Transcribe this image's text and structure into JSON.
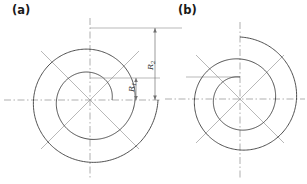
{
  "figure": {
    "kind": "engineering-drawing",
    "background_color": "#ffffff",
    "panels": [
      {
        "id": "a",
        "label": "(a)",
        "center": {
          "x": 90,
          "y": 100
        },
        "spiral": {
          "type": "archimedean",
          "turns": 1.0,
          "start_radius": 22,
          "end_radius": 68,
          "start_angle_deg": 0,
          "direction": "counterclockwise"
        },
        "color": "#3b3b3b",
        "line_width": 0.8
      },
      {
        "id": "b",
        "label": "(b)",
        "center": {
          "x": 240,
          "y": 99
        },
        "spiral": {
          "type": "archimedean",
          "turns": 1.0,
          "start_radius": 22,
          "end_radius": 62,
          "start_angle_deg": 90,
          "direction": "counterclockwise"
        },
        "color": "#3b3b3b",
        "line_width": 0.8
      }
    ],
    "dimensions": [
      {
        "name": "R1",
        "symbol": "R",
        "subscript": "1",
        "label": "R₁",
        "rotation_deg": -90,
        "text_x": 136,
        "text_y": 97,
        "extent_top_y": 78,
        "extent_bottom_y": 100,
        "line_x": 136
      },
      {
        "name": "R2",
        "symbol": "R",
        "subscript": "2",
        "label": "R₂",
        "rotation_deg": -90,
        "text_x": 155,
        "text_y": 62,
        "extent_top_y": 28,
        "extent_bottom_y": 100,
        "line_x": 155
      }
    ],
    "styles": {
      "spiral_stroke": "#3b3b3b",
      "centerline_stroke": "#8c8c8c",
      "radial_stroke": "#9a9a9a",
      "dimension_stroke": "#707070",
      "text_color": "#1a1a1a"
    }
  }
}
